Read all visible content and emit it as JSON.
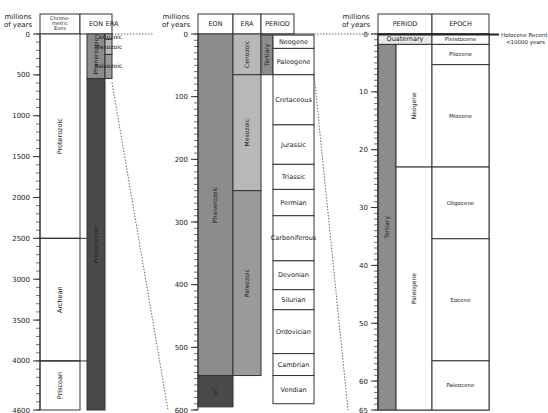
{
  "chart_data": {
    "type": "table",
    "panels": [
      {
        "name": "overall",
        "axis_label": [
          "millions",
          "of years"
        ],
        "range": [
          0,
          4600
        ],
        "ticks": [
          0,
          500,
          1000,
          1500,
          2000,
          2500,
          3000,
          3500,
          4000,
          4600
        ],
        "minor_step": 100,
        "columns": [
          "Chrono-metric Eons",
          "EON",
          "ERA"
        ],
        "chronometric_eons": [
          {
            "label": "Proterozoic",
            "from": 0,
            "to": 2500
          },
          {
            "label": "Archean",
            "from": 2500,
            "to": 4000
          },
          {
            "label": "Priscoan",
            "from": 4000,
            "to": 4600
          }
        ],
        "eons": [
          {
            "label": "Phanerozoic",
            "from": 0,
            "to": 545,
            "color": "#8c8c8c"
          },
          {
            "label": "Precambrian",
            "from": 545,
            "to": 4600,
            "color": "#4a4a4a"
          }
        ],
        "eras": [
          {
            "label": "Cenozoic",
            "from": 0,
            "to": 65,
            "color": "#b8b8b8"
          },
          {
            "label": "Mesozoic",
            "from": 65,
            "to": 250,
            "color": "#b8b8b8"
          },
          {
            "label": "Paleozoic",
            "from": 250,
            "to": 545,
            "color": "#9a9a9a"
          }
        ]
      },
      {
        "name": "phanerozoic",
        "axis_label": [
          "millions",
          "of years"
        ],
        "range": [
          0,
          600
        ],
        "ticks": [
          0,
          100,
          200,
          300,
          400,
          500,
          600
        ],
        "minor_step": 10,
        "columns": [
          "EON",
          "ERA",
          "PERIOD"
        ],
        "eons": [
          {
            "label": "Phanerozoic",
            "from": 0,
            "to": 545,
            "color": "#8c8c8c"
          },
          {
            "label": "pC",
            "from": 545,
            "to": 600,
            "color": "#4a4a4a"
          }
        ],
        "eras": [
          {
            "label": "Cenozoic",
            "from": 0,
            "to": 65,
            "color": "#b8b8b8"
          },
          {
            "label": "Mesozoic",
            "from": 65,
            "to": 250,
            "color": "#b8b8b8"
          },
          {
            "label": "Paleozoic",
            "from": 250,
            "to": 545,
            "color": "#9a9a9a"
          }
        ],
        "subperiods": [
          {
            "label": "Tertiary",
            "from": 1.8,
            "to": 65,
            "color": "#8c8c8c"
          }
        ],
        "periods": [
          {
            "label": "Neogene",
            "from": 1.8,
            "to": 23
          },
          {
            "label": "Paleogene",
            "from": 23,
            "to": 65
          },
          {
            "label": "Cretaceous",
            "from": 65,
            "to": 145
          },
          {
            "label": "Jurassic",
            "from": 145,
            "to": 208
          },
          {
            "label": "Triassic",
            "from": 208,
            "to": 248
          },
          {
            "label": "Permian",
            "from": 248,
            "to": 290
          },
          {
            "label": "Carboniferous",
            "from": 290,
            "to": 362
          },
          {
            "label": "Devonian",
            "from": 362,
            "to": 408
          },
          {
            "label": "Silurian",
            "from": 408,
            "to": 440
          },
          {
            "label": "Ordovician",
            "from": 440,
            "to": 510
          },
          {
            "label": "Cambrian",
            "from": 510,
            "to": 545
          },
          {
            "label": "Vendian",
            "from": 545,
            "to": 590
          }
        ]
      },
      {
        "name": "cenozoic",
        "axis_label": [
          "millions",
          "of years"
        ],
        "range": [
          0,
          65
        ],
        "ticks": [
          0,
          10,
          20,
          30,
          40,
          50,
          60,
          65
        ],
        "minor_step": 1,
        "columns": [
          "PERIOD",
          "EPOCH"
        ],
        "periods": [
          {
            "label": "Quaternary",
            "from": 0,
            "to": 1.8,
            "color": "#e8e8e8"
          },
          {
            "label": "Tertiary",
            "from": 1.8,
            "to": 65,
            "color": "#8c8c8c"
          }
        ],
        "subperiods": [
          {
            "label": "Neogene",
            "from": 1.8,
            "to": 23
          },
          {
            "label": "Paleogene",
            "from": 23,
            "to": 65
          }
        ],
        "epochs": [
          {
            "label": "Pleistocene",
            "from": 0.01,
            "to": 1.8
          },
          {
            "label": "Pliocene",
            "from": 1.8,
            "to": 5.3
          },
          {
            "label": "Miocene",
            "from": 5.3,
            "to": 23
          },
          {
            "label": "Oligocene",
            "from": 23,
            "to": 35.4
          },
          {
            "label": "Eocene",
            "from": 35.4,
            "to": 56.5
          },
          {
            "label": "Paleocene",
            "from": 56.5,
            "to": 65
          }
        ],
        "annotation": [
          "Holocene Recent",
          "<10000 years"
        ]
      }
    ]
  }
}
